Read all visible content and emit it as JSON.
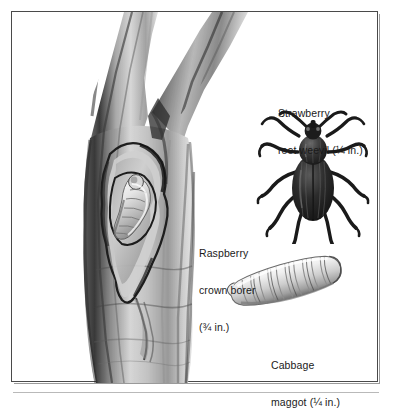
{
  "figure": {
    "kind": "botanical-pest-illustration",
    "caption_labels": [
      {
        "id": "strawberry-root-weevil",
        "line1": "Strawberry",
        "line2": "root weevil (¼ in.)",
        "common_name": "Strawberry root weevil",
        "size": "¼ in."
      },
      {
        "id": "raspberry-crown-borer",
        "line1": "Raspberry",
        "line2": "crown borer",
        "line3": "(¾ in.)",
        "common_name": "Raspberry crown borer",
        "size": "¾ in."
      },
      {
        "id": "cabbage-maggot",
        "line1": "Cabbage",
        "line2": "maggot (¼ in.)",
        "common_name": "Cabbage maggot",
        "size": "¼ in."
      }
    ],
    "subjects": [
      {
        "id": "raspberry-cane",
        "description": "Forked raspberry cane with bark cut away revealing boring gallery"
      },
      {
        "id": "crown-borer-larva",
        "description": "Pale curled borer larva inside cane gallery"
      },
      {
        "id": "root-weevil-beetle",
        "description": "Dark weevil beetle, dorsal view, splayed legs and elbowed antennae"
      },
      {
        "id": "cabbage-maggot-larva",
        "description": "Pale segmented legless maggot, tapered at both ends"
      }
    ],
    "colors": {
      "background": "#ffffff",
      "frame": "#4a4a4a",
      "frame_shadow": "#9a9a9a",
      "text": "#1a1a1a",
      "bark_dark": "#2b2b2b",
      "bark_mid": "#8e8e8e",
      "bark_light": "#dcdcdc",
      "larva_light": "#f2f2f2",
      "beetle_dark": "#1b1b1b"
    }
  }
}
